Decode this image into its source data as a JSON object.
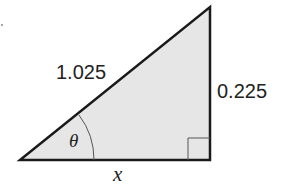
{
  "diagram": {
    "type": "right-triangle",
    "fill_color": "#e6e6e6",
    "stroke_color": "#1a1a1a",
    "hypotenuse_label": "1.025",
    "opposite_label": "0.225",
    "adjacent_label": "x",
    "angle_label": "θ",
    "right_angle_marker": true
  }
}
